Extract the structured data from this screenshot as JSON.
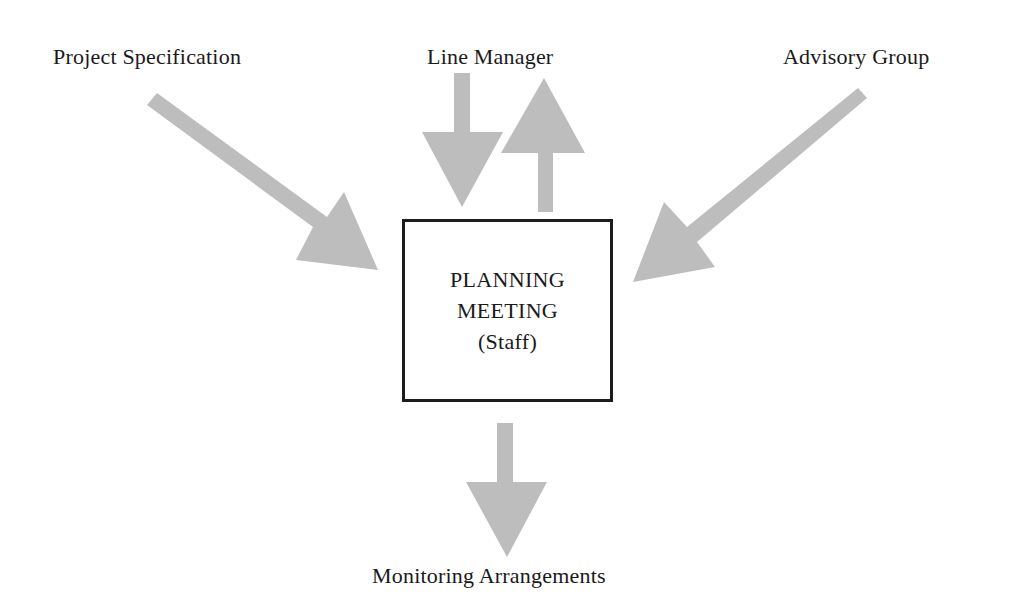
{
  "diagram": {
    "nodes": {
      "project_specification": {
        "label": "Project Specification"
      },
      "line_manager": {
        "label": "Line Manager"
      },
      "advisory_group": {
        "label": "Advisory Group"
      },
      "monitoring_arrangements": {
        "label": "Monitoring Arrangements"
      },
      "planning_meeting": {
        "lines": [
          "PLANNING",
          "MEETING",
          "(Staff)"
        ]
      }
    },
    "edges": [
      {
        "from": "Project Specification",
        "to": "PLANNING MEETING (Staff)",
        "direction": "in"
      },
      {
        "from": "Line Manager",
        "to": "PLANNING MEETING (Staff)",
        "direction": "in"
      },
      {
        "from": "PLANNING MEETING (Staff)",
        "to": "Line Manager",
        "direction": "out"
      },
      {
        "from": "Advisory Group",
        "to": "PLANNING MEETING (Staff)",
        "direction": "in"
      },
      {
        "from": "PLANNING MEETING (Staff)",
        "to": "Monitoring Arrangements",
        "direction": "out"
      }
    ],
    "colors": {
      "arrow_fill": "#bdbdbd",
      "box_border": "#1c1c1c",
      "text": "#1a1a1a",
      "background": "#ffffff"
    }
  }
}
